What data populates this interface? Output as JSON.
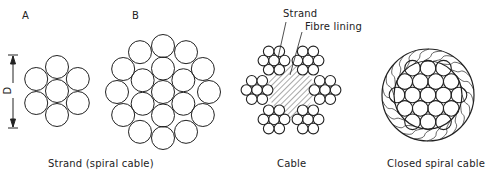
{
  "figure": {
    "strand_a": {
      "label": "A",
      "wire_count": 7
    },
    "strand_b": {
      "label": "B",
      "wire_count": 19
    },
    "dimension": {
      "label": "D"
    },
    "strand_caption": "Strand (spiral cable)",
    "cable": {
      "caption": "Cable",
      "callouts": [
        "Strand",
        "Fibre lining"
      ],
      "strand_count": 6,
      "wires_per_strand": 7
    },
    "closed_spiral": {
      "caption": "Closed spiral cable",
      "inner_wire_count": 19
    }
  },
  "colors": {
    "line": "#222222",
    "background": "#ffffff",
    "hatch": "#555555"
  }
}
